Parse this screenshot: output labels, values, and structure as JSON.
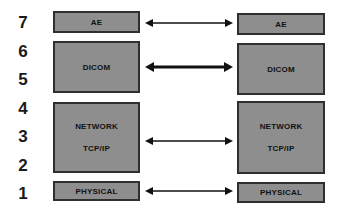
{
  "diagram": {
    "layer_numbers": [
      "7",
      "6",
      "5",
      "4",
      "3",
      "2",
      "1"
    ],
    "left_stack": {
      "ae": "AE",
      "dicom": "DICOM",
      "network": [
        "NETWORK",
        "TCP/IP"
      ],
      "physical": "PHYSICAL"
    },
    "right_stack": {
      "ae": "AE",
      "dicom": "DICOM",
      "network": [
        "NETWORK",
        "TCP/IP"
      ],
      "physical": "PHYSICAL"
    },
    "connections": [
      {
        "from": "left-ae",
        "to": "right-ae",
        "direction": "bidirectional"
      },
      {
        "from": "left-dicom",
        "to": "right-dicom",
        "direction": "bidirectional",
        "emphasis": "bold"
      },
      {
        "from": "left-network",
        "to": "right-network",
        "direction": "bidirectional"
      },
      {
        "from": "left-physical",
        "to": "right-physical",
        "direction": "bidirectional"
      }
    ],
    "colors": {
      "box_fill": "#8e8e8e",
      "box_border": "#2f2f2f",
      "arrow": "#111111"
    }
  }
}
